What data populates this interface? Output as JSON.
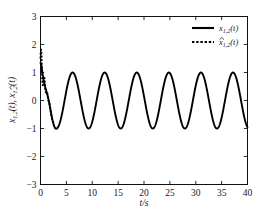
{
  "chart_data": {
    "type": "line",
    "title": "",
    "xlabel": "t/s",
    "ylabel": "x_{1,2}(t), ̂x_{1,2}(t)",
    "xlim": [
      0,
      40
    ],
    "ylim": [
      -3,
      3
    ],
    "xticks": [
      0,
      5,
      10,
      15,
      20,
      25,
      30,
      35,
      40
    ],
    "yticks": [
      -3,
      -2,
      -1,
      0,
      1,
      2,
      3
    ],
    "xtick_labels": [
      "0",
      "5",
      "10",
      "15",
      "20",
      "25",
      "30",
      "35",
      "40"
    ],
    "ytick_labels": [
      "-3",
      "-2",
      "-1",
      "0",
      "1",
      "2",
      "3"
    ],
    "grid": false,
    "legend_position": "upper right",
    "series": [
      {
        "name": "x_{1,2}(t)",
        "style": "solid",
        "color": "#000000",
        "description": "True state: decaying transient from 1.0 settling into steady sinusoid of amplitude 1, period about 6.2 s",
        "amplitude": 1.0,
        "period": 6.2,
        "steady_peaks_t": [
          6.2,
          12.4,
          18.6,
          24.8,
          31.0,
          37.2
        ],
        "steady_troughs_t": [
          9.3,
          15.5,
          21.7,
          27.9,
          34.1,
          40.0
        ]
      },
      {
        "name": "̂x_{1,2}(t)",
        "style": "dotted",
        "color": "#000000",
        "description": "Observer estimate: starts near 1.5 with fast oscillatory transient, converges onto the true state by about t = 3 s",
        "initial_value": 1.5,
        "convergence_time": 3.0
      }
    ],
    "legend": [
      {
        "label_main": "x",
        "label_sub": "1,2",
        "label_tail": "(t)",
        "style": "solid",
        "hat": false
      },
      {
        "label_main": "x",
        "label_sub": "1,2",
        "label_tail": "(t)",
        "style": "dotted",
        "hat": true
      }
    ],
    "ylabel_parts": {
      "first_main": "x",
      "first_sub": "1,2",
      "first_tail": "(t),",
      "second_main": "x",
      "second_sub": "1,2",
      "second_tail": "(t)"
    }
  },
  "axes": {
    "x_axis_name": "time-axis",
    "y_axis_name": "amplitude-axis"
  }
}
